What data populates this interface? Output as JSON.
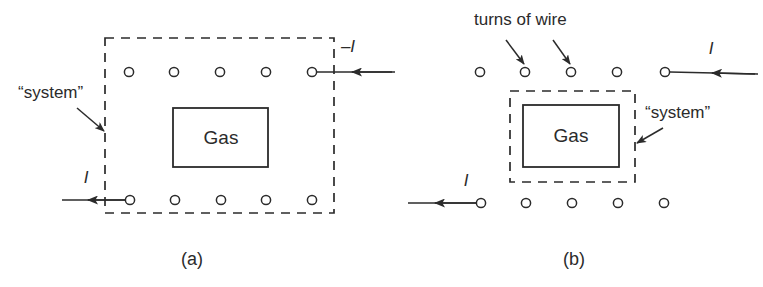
{
  "figure": {
    "panels": [
      {
        "id": "a",
        "caption": "(a)",
        "caption_x": 192,
        "caption_y": 265,
        "system_label": "“system”",
        "system_label_x": 18,
        "system_label_y": 98,
        "gas_label": "Gas",
        "gas_label_x": 221,
        "gas_label_y": 144,
        "current_top_label": "–I",
        "current_top_x": 348,
        "current_top_y": 52,
        "current_bottom_label": "I",
        "current_bottom_x": 86,
        "current_bottom_y": 183,
        "boundary": {
          "x": 105,
          "y": 38,
          "w": 229,
          "h": 175
        },
        "gas_box": {
          "x": 173,
          "y": 108,
          "w": 95,
          "h": 59
        },
        "coil_top_y": 72,
        "coil_bottom_y": 200,
        "coil_top_x": [
          129,
          174,
          220,
          266,
          312
        ],
        "coil_bottom_x": [
          130,
          175,
          221,
          266,
          312
        ],
        "coil_radius": 4.6
      },
      {
        "id": "b",
        "caption": "(b)",
        "caption_x": 574,
        "caption_y": 265,
        "system_label": "“system”",
        "system_label_x": 645,
        "system_label_y": 118,
        "gas_label": "Gas",
        "gas_label_x": 571,
        "gas_label_y": 142,
        "turns_label": "turns of wire",
        "turns_label_x": 474,
        "turns_label_y": 25,
        "current_top_label": "I",
        "current_top_x": 711,
        "current_top_y": 54,
        "current_bottom_label": "I",
        "current_bottom_x": 466,
        "current_bottom_y": 186,
        "boundary": {
          "x": 510,
          "y": 91,
          "w": 125,
          "h": 91
        },
        "gas_box": {
          "x": 523,
          "y": 105,
          "w": 96,
          "h": 62
        },
        "coil_top_y": 72,
        "coil_bottom_y": 203,
        "coil_top_x": [
          480,
          525,
          571,
          617,
          665
        ],
        "coil_bottom_x": [
          481,
          526,
          572,
          618,
          664
        ],
        "coil_radius": 4.6
      }
    ],
    "colors": {
      "ink": "#2b2b2b",
      "background": "#ffffff"
    }
  }
}
